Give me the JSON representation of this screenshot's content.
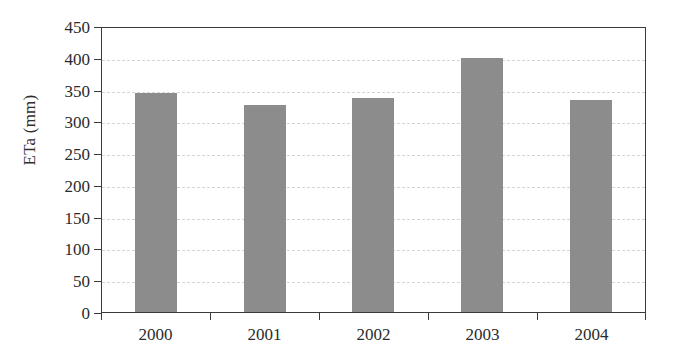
{
  "chart_data": {
    "type": "bar",
    "title": "",
    "subtitle": "",
    "xlabel": "",
    "ylabel": "ETa (mm)",
    "categories": [
      "2000",
      "2001",
      "2002",
      "2003",
      "2004"
    ],
    "values": [
      344,
      325,
      336,
      400,
      333
    ],
    "series": [
      {
        "name": "ETa",
        "values": [
          344,
          325,
          336,
          400,
          333
        ]
      }
    ],
    "ylim": [
      0,
      450
    ],
    "y_ticks": [
      0,
      50,
      100,
      150,
      200,
      250,
      300,
      350,
      400,
      450
    ],
    "y_tick_labels": [
      "0",
      "50",
      "100",
      "150",
      "200",
      "250",
      "300",
      "350",
      "400",
      "450"
    ],
    "grid": "horizontal-dashed",
    "legend": "none",
    "bar_color": "#8c8c8c",
    "axis_color": "#3a3a3a",
    "grid_color": "#d6d6d6",
    "background": "#ffffff"
  }
}
